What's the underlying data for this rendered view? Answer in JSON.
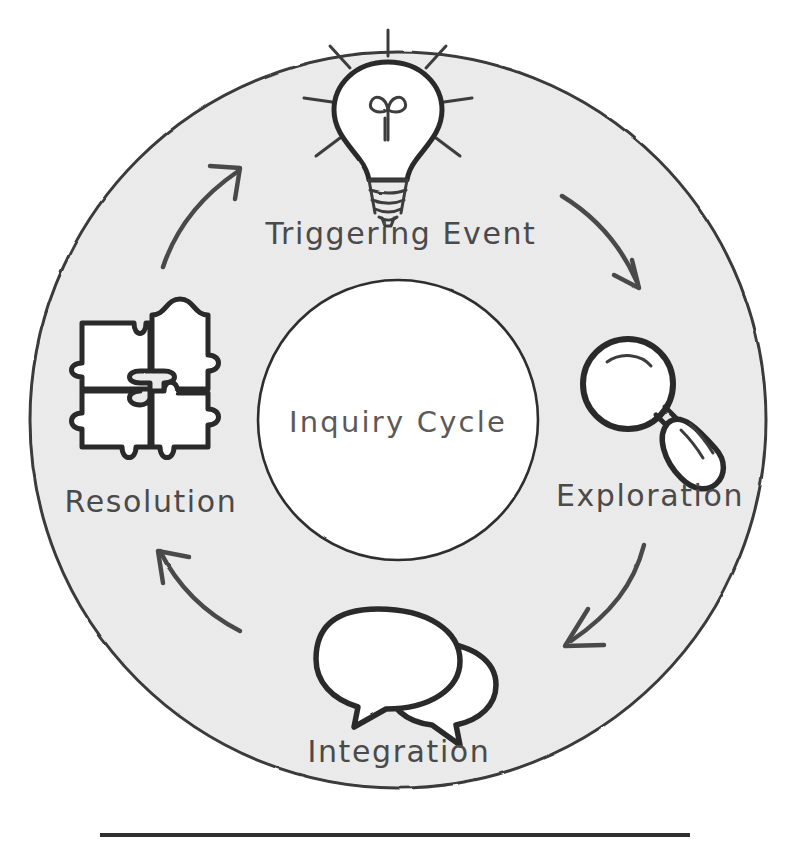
{
  "diagram": {
    "center_label": "Inquiry Cycle",
    "style": {
      "ring_fill": "#efefef",
      "ring_stroke": "#3a3a3a",
      "inner_fill": "#ffffff",
      "ink_color": "#3a3a3a",
      "arrow_color": "#4a4a4a",
      "background": "#ffffff",
      "rule_color": "#2f2f2f"
    },
    "geometry": {
      "center_x": 398,
      "center_y": 420,
      "outer_radius": 368,
      "inner_radius": 140
    },
    "stages": [
      {
        "id": "triggering-event",
        "label": "Triggering Event",
        "icon": "lightbulb-icon",
        "position": "top",
        "order": 1
      },
      {
        "id": "exploration",
        "label": "Exploration",
        "icon": "magnifying-glass-icon",
        "position": "right",
        "order": 2
      },
      {
        "id": "integration",
        "label": "Integration",
        "icon": "speech-bubbles-icon",
        "position": "bottom",
        "order": 3
      },
      {
        "id": "resolution",
        "label": "Resolution",
        "icon": "puzzle-pieces-icon",
        "position": "left",
        "order": 4
      }
    ],
    "arrows": [
      {
        "id": "arrow-triggering-to-exploration",
        "from": "triggering-event",
        "to": "exploration",
        "direction": "clockwise"
      },
      {
        "id": "arrow-exploration-to-integration",
        "from": "exploration",
        "to": "integration",
        "direction": "clockwise"
      },
      {
        "id": "arrow-integration-to-resolution",
        "from": "integration",
        "to": "resolution",
        "direction": "clockwise"
      },
      {
        "id": "arrow-resolution-to-triggering",
        "from": "resolution",
        "to": "triggering-event",
        "direction": "clockwise"
      }
    ],
    "footer_rule": {
      "x1": 100,
      "x2": 690,
      "y": 835
    }
  }
}
